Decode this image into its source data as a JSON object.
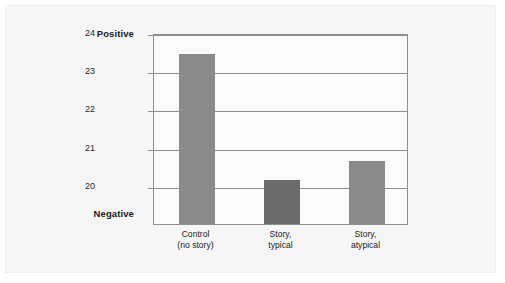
{
  "chart_data": {
    "type": "bar",
    "title": "",
    "subtitle": "",
    "xlabel": "",
    "ylabel": "",
    "categories": [
      "Control\n(no story)",
      "Story,\ntypical",
      "Story,\natypical"
    ],
    "category_lines": [
      [
        "Control",
        "(no story)"
      ],
      [
        "Story,",
        "typical"
      ],
      [
        "Story,",
        "atypical"
      ]
    ],
    "values": [
      23.47,
      20.18,
      20.68
    ],
    "series": [
      {
        "name": "",
        "values": [
          23.47,
          20.18,
          20.68
        ],
        "colors": [
          "#8a8a8a",
          "#6b6b6b",
          "#8a8a8a"
        ]
      }
    ],
    "ylim": [
      19.0,
      24.0
    ],
    "yticks": [
      24,
      23,
      22,
      21,
      20
    ],
    "ytick_labels": [
      "24",
      "23",
      "22",
      "21",
      "20"
    ],
    "axis_endpoint_labels": {
      "top": "Positive",
      "bottom": "Negative"
    },
    "grid": true,
    "grid_axis": "y",
    "legend": false,
    "legend_position": "none",
    "bar_colors": {
      "light_gray": "#8a8a8a",
      "dark_gray": "#6b6b6b"
    },
    "axis_color": "#8f8f8f",
    "background_color": "#f6f6f6",
    "plot_background_color": "#fbfbfb"
  },
  "figure": {
    "y_axis_top_label": "Positive",
    "y_axis_bottom_label": "Negative"
  }
}
